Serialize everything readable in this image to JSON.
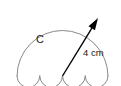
{
  "figure": {
    "name": "scalloped-semicircle-diagram",
    "background_color": "#ffffff",
    "outline_color": "#8a8a8a",
    "arrow_color": "#000000",
    "text_color": "#1a1a1a",
    "region_label": "C",
    "measurement_label": "4 cm",
    "measurement_value": 4,
    "measurement_unit": "cm"
  },
  "geometry": {
    "big_arc": {
      "shape": "semicircle",
      "center_x": 62.5,
      "center_y": 76,
      "radius": 45.5,
      "start_x": 17,
      "start_y": 76,
      "end_x": 108,
      "end_y": 76,
      "sweep": "upper-half"
    },
    "scallops": {
      "count": 4,
      "shape": "semicircle",
      "radius": 11.375,
      "direction": "downward",
      "centers_x": [
        28.375,
        51.125,
        73.875,
        96.625
      ],
      "center_y": 76
    },
    "radius_arrow": {
      "from_x": 62.5,
      "from_y": 76,
      "to_x": 98,
      "to_y": 18,
      "head_length": 12,
      "head_width": 7.5
    },
    "label_positions": {
      "region_label_x": 40,
      "region_label_y": 43,
      "measurement_label_x": 83,
      "measurement_label_y": 56
    }
  }
}
